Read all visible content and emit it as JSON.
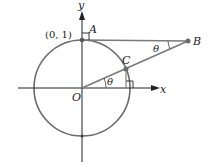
{
  "diagram": {
    "type": "unit-circle-geometry",
    "labels": {
      "y_axis": "y",
      "x_axis": "x",
      "origin": "O",
      "point_a": "A",
      "point_a_coord": "(0, 1)",
      "point_b": "B",
      "point_c": "C",
      "angle_at_o": "θ",
      "angle_at_b": "θ"
    },
    "colors": {
      "circle": "#6b6b6b",
      "lines": "#7a7a7a",
      "axes": "#222222",
      "points": "#6b6b6b"
    },
    "elements": [
      "unit circle centered at O",
      "x-axis and y-axis",
      "horizontal segment from A to B",
      "segment from O through C to B",
      "right-angle marker at A",
      "right-angle marker at foot of C on x-axis",
      "angle θ at O between x-axis and OB",
      "angle θ at B between BA and BO"
    ]
  }
}
